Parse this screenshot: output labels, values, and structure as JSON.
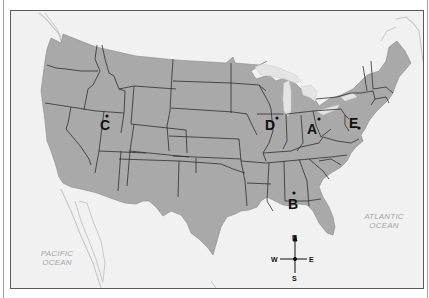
{
  "map": {
    "title": "",
    "colors": {
      "land": "#a9a9a9",
      "water": "#f1f1f1",
      "border": "#2e2e2e",
      "coast_outline": "#c8c8c8",
      "frame": "#5a5a5a"
    },
    "points": [
      {
        "id": "A",
        "label": "A"
      },
      {
        "id": "B",
        "label": "B"
      },
      {
        "id": "C",
        "label": "C"
      },
      {
        "id": "D",
        "label": "D"
      },
      {
        "id": "E",
        "label": "E"
      }
    ],
    "oceans": [
      {
        "id": "pacific",
        "line1": "PACIFIC",
        "line2": "OCEAN"
      },
      {
        "id": "atlantic",
        "line1": "ATLANTIC",
        "line2": "OCEAN"
      }
    ],
    "compass": {
      "north": "N",
      "south": "S",
      "east": "E",
      "west": "W"
    }
  }
}
